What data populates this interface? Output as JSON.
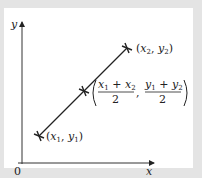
{
  "diagram": {
    "type": "coordinate-geometry-midpoint",
    "axes": {
      "x_label": "x",
      "y_label": "y",
      "origin_label": "0"
    },
    "points": [
      {
        "id": "p1",
        "label_var_x": "x",
        "label_sub_x": "1",
        "label_var_y": "y",
        "label_sub_y": "1"
      },
      {
        "id": "mid",
        "label": "((x1 + x2)/2, (y1 + y2)/2)",
        "num_x": "x",
        "num_x_sub1": "1",
        "plus": "+",
        "num_x2": "x",
        "num_x_sub2": "2",
        "num_y": "y",
        "num_y_sub1": "1",
        "num_y2": "y",
        "num_y_sub2": "2",
        "denominator": "2"
      },
      {
        "id": "p2",
        "label_var_x": "x",
        "label_sub_x": "2",
        "label_var_y": "y",
        "label_sub_y": "2"
      }
    ],
    "colors": {
      "frame": "#e4e4e4",
      "panel": "#ffffff",
      "ink": "#222222"
    }
  }
}
